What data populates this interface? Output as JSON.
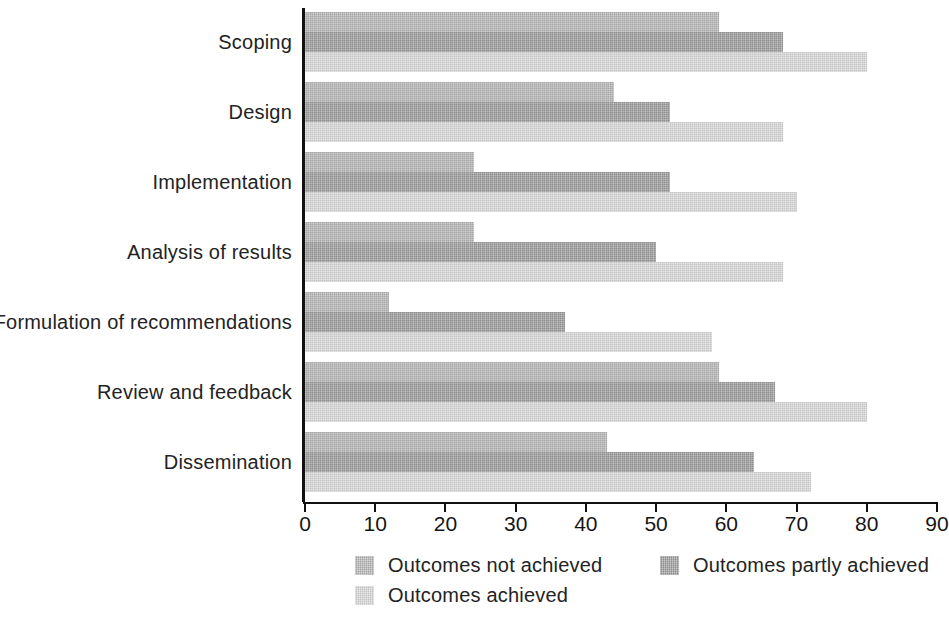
{
  "chart": {
    "type": "bar",
    "orientation": "horizontal",
    "title": "",
    "xlabel": "",
    "ylabel": ""
  },
  "axis": {
    "x_min": 0,
    "x_max": 90,
    "x_ticks": [
      0,
      10,
      20,
      30,
      40,
      50,
      60,
      70,
      80,
      90
    ],
    "x_tick_labels": [
      "0",
      "10",
      "20",
      "30",
      "40",
      "50",
      "60",
      "70",
      "80",
      "90"
    ],
    "grid": "off"
  },
  "legend": {
    "position": "bottom",
    "items": [
      {
        "label": "Outcomes not achieved",
        "color": "#b4b4b4"
      },
      {
        "label": "Outcomes partly achieved",
        "color": "#9a9a9a"
      },
      {
        "label": "Outcomes achieved",
        "color": "#d6d6d6"
      }
    ]
  },
  "chart_data": {
    "type": "bar",
    "orientation": "horizontal",
    "title": "",
    "xlabel": "",
    "ylabel": "",
    "xlim": [
      0,
      90
    ],
    "grid": false,
    "legend_position": "bottom",
    "categories": [
      "Scoping",
      "Design",
      "Implementation",
      "Analysis of results",
      "Formulation of recommendations",
      "Review and feedback",
      "Dissemination"
    ],
    "series": [
      {
        "name": "Outcomes not achieved",
        "color": "#b4b4b4",
        "values": [
          59,
          44,
          24,
          24,
          12,
          59,
          43
        ]
      },
      {
        "name": "Outcomes partly achieved",
        "color": "#9a9a9a",
        "values": [
          68,
          52,
          52,
          50,
          37,
          67,
          64
        ]
      },
      {
        "name": "Outcomes achieved",
        "color": "#d6d6d6",
        "values": [
          80,
          68,
          70,
          68,
          58,
          80,
          72
        ]
      }
    ]
  }
}
